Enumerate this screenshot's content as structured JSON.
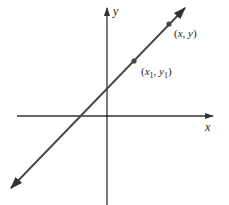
{
  "figure": {
    "type": "line-through-two-points",
    "axes": {
      "x_label": "x",
      "y_label": "y"
    },
    "line": {
      "description": "straight line with positive slope extending infinitely in both directions",
      "x_intercept_side": "negative",
      "y_intercept_side": "positive"
    },
    "points": [
      {
        "name": "fixed-point",
        "label_main_x": "x",
        "label_sub_x": "1",
        "label_main_y": "y",
        "label_sub_y": "1",
        "label_text": "(x1, y1)"
      },
      {
        "name": "general-point",
        "label_main_x": "x",
        "label_main_y": "y",
        "label_text": "(x, y)"
      }
    ],
    "colors": {
      "ink": "#333333",
      "background": "#ffffff"
    }
  }
}
